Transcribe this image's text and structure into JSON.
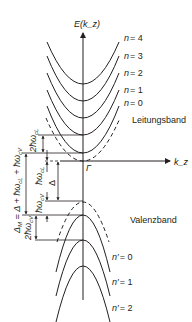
{
  "axes": {
    "y_label": "E(k_z)",
    "x_label": "k_z",
    "origin_label": "Γ"
  },
  "conduction_band": {
    "label": "Leitungsband",
    "levels": [
      {
        "n": "n = 4",
        "y": 84
      },
      {
        "n": "n = 3",
        "y": 101
      },
      {
        "n": "n = 2",
        "y": 118
      },
      {
        "n": "n = 1",
        "y": 135
      },
      {
        "n": "n = 0",
        "y": 153
      }
    ]
  },
  "valence_band": {
    "label": "Valenzband",
    "levels": [
      {
        "n": "n′ = 0",
        "y": 215
      },
      {
        "n": "n′ = 1",
        "y": 240
      },
      {
        "n": "n′ = 2",
        "y": 266
      }
    ]
  },
  "annotations": {
    "two_hw_cL": "2ħω",
    "two_hw_cL_sub": "cL",
    "hw_cL": "ħω",
    "hw_cL_sub": "cL",
    "delta": "Δ",
    "hw_cV": "ħω",
    "hw_cV_sub": "cV",
    "delta_M": "Δ",
    "delta_M_text": "Δ_M = Δ + ħω_cL + ħω_cV",
    "two_hw_cV": "2ħω",
    "two_hw_cV_sub": "cV"
  },
  "colors": {
    "line": "#231f20",
    "background": "#ffffff"
  }
}
